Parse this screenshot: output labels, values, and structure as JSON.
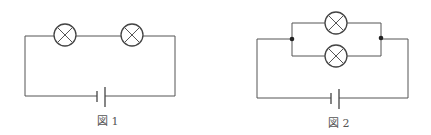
{
  "figures": [
    {
      "id": "fig1",
      "caption": "図 1",
      "circuit": "series",
      "lamps": 2,
      "batteries": 1
    },
    {
      "id": "fig2",
      "caption": "図 2",
      "circuit": "parallel",
      "lamps": 2,
      "batteries": 1,
      "junctions": 2
    }
  ],
  "colors": {
    "wire": "#555555",
    "lamp": "#444444",
    "junction": "#222222",
    "background": "#ffffff"
  }
}
